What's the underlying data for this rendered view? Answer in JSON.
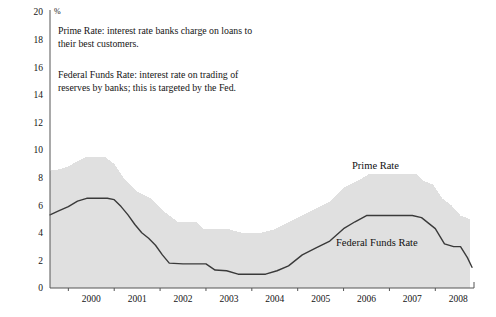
{
  "chart_data": {
    "type": "area",
    "title": "",
    "xlabel": "",
    "ylabel": "%",
    "ylim": [
      0,
      20
    ],
    "xlim": [
      1999.6,
      2008.8
    ],
    "grid": false,
    "legend_position": "inline-annotations",
    "y_ticks": [
      "0",
      "2",
      "4",
      "6",
      "8",
      "10",
      "12",
      "14",
      "16",
      "18",
      "20"
    ],
    "y_tick_values": [
      0,
      2,
      4,
      6,
      8,
      10,
      12,
      14,
      16,
      18,
      20
    ],
    "x_ticks": [
      "2000",
      "2001",
      "2002",
      "2003",
      "2004",
      "2005",
      "2006",
      "2007",
      "2008"
    ],
    "x_tick_values": [
      2000,
      2001,
      2002,
      2003,
      2004,
      2005,
      2006,
      2007,
      2008
    ],
    "series": [
      {
        "name": "Prime Rate",
        "style": "filled-area",
        "color": "#e0e0e0",
        "x": [
          1999.6,
          1999.8,
          2000.0,
          2000.2,
          2000.4,
          2000.55,
          2000.8,
          2001.0,
          2001.1,
          2001.2,
          2001.35,
          2001.5,
          2001.65,
          2001.8,
          2001.95,
          2002.1,
          2002.4,
          2002.8,
          2002.95,
          2003.2,
          2003.5,
          2003.8,
          2004.2,
          2004.5,
          2004.8,
          2005.1,
          2005.4,
          2005.7,
          2006.0,
          2006.3,
          2006.55,
          2006.9,
          2007.3,
          2007.6,
          2007.75,
          2007.95,
          2008.15,
          2008.35,
          2008.55,
          2008.75
        ],
        "values": [
          8.5,
          8.6,
          8.8,
          9.2,
          9.5,
          9.5,
          9.5,
          9.0,
          8.5,
          8.0,
          7.5,
          7.0,
          6.75,
          6.5,
          6.0,
          5.5,
          4.75,
          4.75,
          4.25,
          4.25,
          4.25,
          4.0,
          4.0,
          4.25,
          4.75,
          5.25,
          5.75,
          6.25,
          7.25,
          7.75,
          8.25,
          8.25,
          8.25,
          8.25,
          7.75,
          7.5,
          6.5,
          6.0,
          5.25,
          5.0
        ]
      },
      {
        "name": "Federal Funds Rate",
        "style": "line",
        "color": "#3a3a3a",
        "x": [
          1999.6,
          1999.8,
          2000.0,
          2000.2,
          2000.4,
          2000.6,
          2000.85,
          2001.0,
          2001.15,
          2001.3,
          2001.45,
          2001.6,
          2001.75,
          2001.9,
          2002.05,
          2002.2,
          2002.5,
          2002.85,
          2003.0,
          2003.2,
          2003.45,
          2003.7,
          2004.0,
          2004.3,
          2004.55,
          2004.8,
          2005.1,
          2005.4,
          2005.7,
          2006.0,
          2006.25,
          2006.5,
          2006.8,
          2007.2,
          2007.5,
          2007.7,
          2007.85,
          2008.0,
          2008.2,
          2008.4,
          2008.55,
          2008.7,
          2008.8
        ],
        "values": [
          5.3,
          5.6,
          5.9,
          6.3,
          6.5,
          6.5,
          6.5,
          6.4,
          5.9,
          5.3,
          4.6,
          4.0,
          3.6,
          3.1,
          2.4,
          1.8,
          1.75,
          1.75,
          1.75,
          1.3,
          1.25,
          1.0,
          1.0,
          1.0,
          1.25,
          1.6,
          2.4,
          2.9,
          3.4,
          4.3,
          4.8,
          5.25,
          5.25,
          5.25,
          5.25,
          5.1,
          4.7,
          4.3,
          3.2,
          3.0,
          3.0,
          2.2,
          1.5
        ]
      }
    ],
    "annotations": [
      {
        "id": "note-prime",
        "text": "Prime Rate: interest rate banks charge on loans to\ntheir best customers."
      },
      {
        "id": "note-ffr",
        "text": "Federal Funds Rate: interest rate on trading of\nreserves by banks; this is targeted by the Fed."
      },
      {
        "id": "label-prime",
        "text": "Prime Rate"
      },
      {
        "id": "label-ffr",
        "text": "Federal Funds Rate"
      }
    ],
    "axis_unit_label": "%",
    "colors": {
      "area_fill": "#e0e0e0",
      "line": "#3a3a3a",
      "axis": "#555555",
      "text": "#141414",
      "background": "#ffffff"
    }
  },
  "labels": {
    "y_unit": "%",
    "prime_series": "Prime Rate",
    "ffr_series": "Federal Funds Rate",
    "note_prime": "Prime Rate: interest rate banks charge on loans to\ntheir best customers.",
    "note_ffr": "Federal Funds Rate: interest rate on trading of\nreserves by banks; this is targeted by the Fed."
  }
}
